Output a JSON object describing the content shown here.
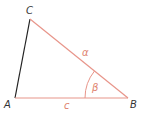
{
  "diagram": {
    "type": "triangle",
    "vertices": [
      {
        "id": "A",
        "label": "A"
      },
      {
        "id": "B",
        "label": "B"
      },
      {
        "id": "C",
        "label": "C"
      }
    ],
    "sides": [
      {
        "id": "a",
        "label": "α",
        "from": "B",
        "to": "C",
        "color": "#e8958a"
      },
      {
        "id": "c",
        "label": "c",
        "from": "A",
        "to": "B",
        "color": "#e8958a"
      },
      {
        "id": "b",
        "label": "",
        "from": "A",
        "to": "C",
        "color": "#222222"
      }
    ],
    "angles": [
      {
        "id": "beta",
        "label": "β",
        "at": "B",
        "color": "#e8958a"
      }
    ]
  }
}
